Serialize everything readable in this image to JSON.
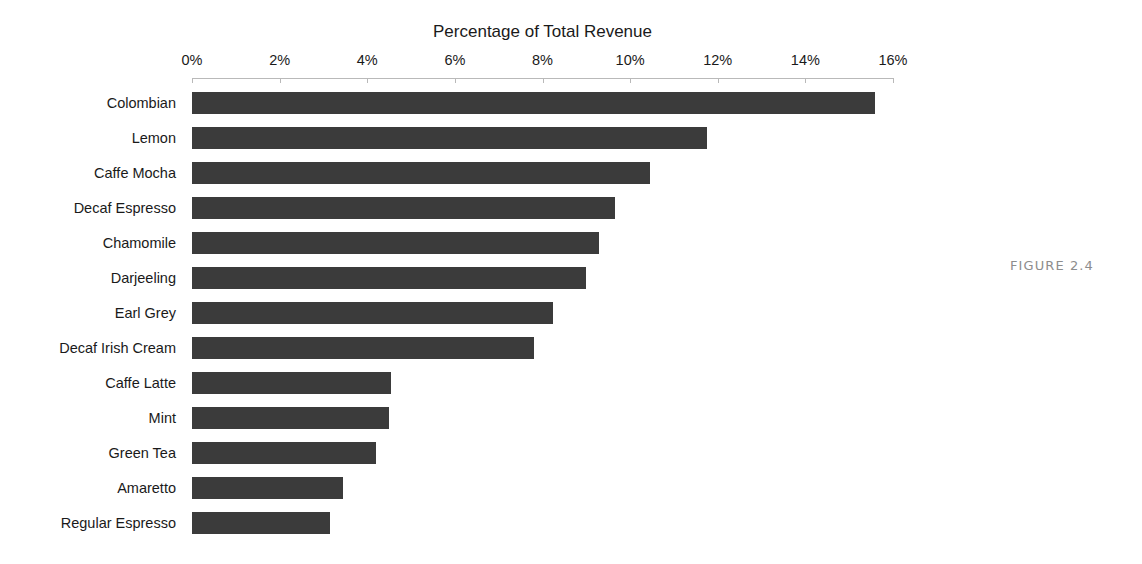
{
  "figure": {
    "caption": "FIGURE 2.4"
  },
  "chart_data": {
    "type": "bar",
    "orientation": "horizontal",
    "title": "Percentage of Total Revenue",
    "xlabel": "",
    "ylabel": "",
    "xlim": [
      0,
      16
    ],
    "xtick_labels": [
      "0%",
      "2%",
      "4%",
      "6%",
      "8%",
      "10%",
      "12%",
      "14%",
      "16%"
    ],
    "xticks": [
      0,
      2,
      4,
      6,
      8,
      10,
      12,
      14,
      16
    ],
    "grid": false,
    "legend": false,
    "bar_color": "#3b3b3b",
    "axis_color": "#b9b9b9",
    "categories": [
      "Colombian",
      "Lemon",
      "Caffe Mocha",
      "Decaf Espresso",
      "Chamomile",
      "Darjeeling",
      "Earl Grey",
      "Decaf Irish Cream",
      "Caffe Latte",
      "Mint",
      "Green Tea",
      "Amaretto",
      "Regular Espresso"
    ],
    "values": [
      15.6,
      11.75,
      10.45,
      9.65,
      9.3,
      9.0,
      8.25,
      7.8,
      4.55,
      4.5,
      4.2,
      3.45,
      3.15
    ]
  }
}
